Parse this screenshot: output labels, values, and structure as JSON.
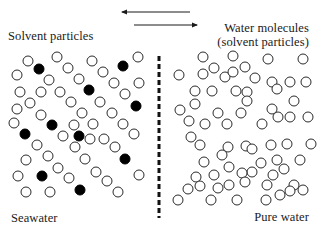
{
  "labels": {
    "solvent_particles": "Solvent particles",
    "water_molecules_line1": "Water molecules",
    "water_molecules_line2": "(solvent particles)",
    "seawater": "Seawater",
    "pure_water": "Pure water"
  },
  "colors": {
    "stroke": "#2a2a2a",
    "solute_fill": "#000000",
    "particle_fill": "#ffffff",
    "membrane": "#111111",
    "background": "#ffffff"
  },
  "arrows": [
    {
      "direction": "left",
      "x1": 190,
      "x2": 122,
      "y": 12
    },
    {
      "direction": "right",
      "x1": 134,
      "x2": 197,
      "y": 25
    }
  ],
  "membrane": {
    "x": 159,
    "y1": 56,
    "y2": 218,
    "style": "dashed"
  },
  "particle_radius": 5,
  "seawater_particles": [
    {
      "x": 28,
      "y": 61,
      "solute": false
    },
    {
      "x": 57,
      "y": 57,
      "solute": false
    },
    {
      "x": 92,
      "y": 61,
      "solute": false
    },
    {
      "x": 138,
      "y": 57,
      "solute": false
    },
    {
      "x": 123,
      "y": 66,
      "solute": true
    },
    {
      "x": 39,
      "y": 69,
      "solute": true
    },
    {
      "x": 68,
      "y": 68,
      "solute": false
    },
    {
      "x": 103,
      "y": 72,
      "solute": false
    },
    {
      "x": 17,
      "y": 75,
      "solute": false
    },
    {
      "x": 49,
      "y": 80,
      "solute": false
    },
    {
      "x": 79,
      "y": 79,
      "solute": false
    },
    {
      "x": 114,
      "y": 83,
      "solute": false
    },
    {
      "x": 139,
      "y": 83,
      "solute": false
    },
    {
      "x": 20,
      "y": 92,
      "solute": false
    },
    {
      "x": 41,
      "y": 92,
      "solute": false
    },
    {
      "x": 60,
      "y": 92,
      "solute": false
    },
    {
      "x": 89,
      "y": 90,
      "solute": true
    },
    {
      "x": 125,
      "y": 94,
      "solute": false
    },
    {
      "x": 30,
      "y": 103,
      "solute": false
    },
    {
      "x": 71,
      "y": 102,
      "solute": false
    },
    {
      "x": 100,
      "y": 102,
      "solute": false
    },
    {
      "x": 136,
      "y": 106,
      "solute": true
    },
    {
      "x": 17,
      "y": 109,
      "solute": false
    },
    {
      "x": 41,
      "y": 115,
      "solute": false
    },
    {
      "x": 82,
      "y": 113,
      "solute": false
    },
    {
      "x": 112,
      "y": 113,
      "solute": false
    },
    {
      "x": 14,
      "y": 123,
      "solute": false
    },
    {
      "x": 52,
      "y": 125,
      "solute": true
    },
    {
      "x": 74,
      "y": 125,
      "solute": false
    },
    {
      "x": 93,
      "y": 124,
      "solute": false
    },
    {
      "x": 123,
      "y": 124,
      "solute": false
    },
    {
      "x": 25,
      "y": 134,
      "solute": true
    },
    {
      "x": 63,
      "y": 136,
      "solute": false
    },
    {
      "x": 79,
      "y": 136,
      "solute": true
    },
    {
      "x": 90,
      "y": 139,
      "solute": false
    },
    {
      "x": 104,
      "y": 139,
      "solute": false
    },
    {
      "x": 134,
      "y": 134,
      "solute": false
    },
    {
      "x": 37,
      "y": 145,
      "solute": false
    },
    {
      "x": 75,
      "y": 147,
      "solute": false
    },
    {
      "x": 115,
      "y": 147,
      "solute": false
    },
    {
      "x": 26,
      "y": 160,
      "solute": false
    },
    {
      "x": 48,
      "y": 156,
      "solute": false
    },
    {
      "x": 85,
      "y": 159,
      "solute": false
    },
    {
      "x": 125,
      "y": 159,
      "solute": true
    },
    {
      "x": 58,
      "y": 168,
      "solute": false
    },
    {
      "x": 96,
      "y": 172,
      "solute": false
    },
    {
      "x": 18,
      "y": 176,
      "solute": false
    },
    {
      "x": 42,
      "y": 176,
      "solute": true
    },
    {
      "x": 69,
      "y": 178,
      "solute": false
    },
    {
      "x": 107,
      "y": 181,
      "solute": false
    },
    {
      "x": 139,
      "y": 175,
      "solute": false
    },
    {
      "x": 26,
      "y": 192,
      "solute": false
    },
    {
      "x": 50,
      "y": 192,
      "solute": false
    },
    {
      "x": 80,
      "y": 190,
      "solute": true
    },
    {
      "x": 118,
      "y": 192,
      "solute": false
    }
  ],
  "pure_water_particles": [
    {
      "x": 203,
      "y": 57
    },
    {
      "x": 233,
      "y": 56
    },
    {
      "x": 268,
      "y": 59
    },
    {
      "x": 303,
      "y": 59
    },
    {
      "x": 179,
      "y": 75
    },
    {
      "x": 203,
      "y": 74
    },
    {
      "x": 214,
      "y": 68
    },
    {
      "x": 225,
      "y": 77
    },
    {
      "x": 233,
      "y": 72
    },
    {
      "x": 245,
      "y": 67
    },
    {
      "x": 255,
      "y": 78
    },
    {
      "x": 272,
      "y": 82
    },
    {
      "x": 290,
      "y": 82
    },
    {
      "x": 195,
      "y": 91
    },
    {
      "x": 212,
      "y": 91
    },
    {
      "x": 236,
      "y": 91
    },
    {
      "x": 247,
      "y": 92
    },
    {
      "x": 277,
      "y": 89
    },
    {
      "x": 294,
      "y": 101
    },
    {
      "x": 306,
      "y": 82
    },
    {
      "x": 195,
      "y": 104
    },
    {
      "x": 247,
      "y": 101
    },
    {
      "x": 272,
      "y": 109
    },
    {
      "x": 290,
      "y": 117
    },
    {
      "x": 180,
      "y": 110
    },
    {
      "x": 218,
      "y": 113
    },
    {
      "x": 241,
      "y": 113
    },
    {
      "x": 278,
      "y": 117
    },
    {
      "x": 308,
      "y": 117
    },
    {
      "x": 189,
      "y": 121
    },
    {
      "x": 205,
      "y": 124
    },
    {
      "x": 227,
      "y": 124
    },
    {
      "x": 262,
      "y": 124
    },
    {
      "x": 191,
      "y": 137
    },
    {
      "x": 200,
      "y": 145
    },
    {
      "x": 228,
      "y": 147
    },
    {
      "x": 246,
      "y": 146
    },
    {
      "x": 271,
      "y": 145
    },
    {
      "x": 287,
      "y": 144
    },
    {
      "x": 311,
      "y": 144
    },
    {
      "x": 222,
      "y": 155
    },
    {
      "x": 252,
      "y": 149
    },
    {
      "x": 261,
      "y": 163
    },
    {
      "x": 277,
      "y": 160
    },
    {
      "x": 300,
      "y": 160
    },
    {
      "x": 204,
      "y": 162
    },
    {
      "x": 229,
      "y": 167
    },
    {
      "x": 252,
      "y": 172
    },
    {
      "x": 273,
      "y": 175
    },
    {
      "x": 196,
      "y": 177
    },
    {
      "x": 214,
      "y": 175
    },
    {
      "x": 242,
      "y": 173
    },
    {
      "x": 284,
      "y": 169
    },
    {
      "x": 188,
      "y": 189
    },
    {
      "x": 200,
      "y": 186
    },
    {
      "x": 218,
      "y": 188
    },
    {
      "x": 229,
      "y": 185
    },
    {
      "x": 245,
      "y": 182
    },
    {
      "x": 267,
      "y": 185
    },
    {
      "x": 294,
      "y": 185
    },
    {
      "x": 178,
      "y": 200
    },
    {
      "x": 211,
      "y": 200
    },
    {
      "x": 237,
      "y": 200
    },
    {
      "x": 266,
      "y": 200
    },
    {
      "x": 280,
      "y": 195
    },
    {
      "x": 290,
      "y": 191
    },
    {
      "x": 303,
      "y": 190
    }
  ]
}
